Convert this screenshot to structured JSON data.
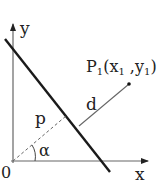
{
  "diagram": {
    "axes": {
      "x_label": "x",
      "y_label": "y",
      "origin_label": "0"
    },
    "point": {
      "name": "P",
      "sub": "1",
      "coords_open": "(x",
      "x_sub": "1",
      "sep": " ,y",
      "y_sub": "1",
      "close": ")"
    },
    "labels": {
      "p": "p",
      "d": "d",
      "alpha": "α"
    },
    "colors": {
      "line": "#1a1a1a",
      "axis": "#555555",
      "text": "#222222"
    }
  }
}
